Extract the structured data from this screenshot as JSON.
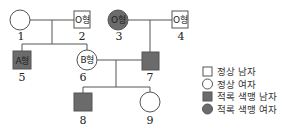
{
  "pedigree": {
    "individuals": [
      {
        "id": "1",
        "sex": "female",
        "status": "normal",
        "blood_type": ""
      },
      {
        "id": "2",
        "sex": "male",
        "status": "normal",
        "blood_type": "O형"
      },
      {
        "id": "3",
        "sex": "female",
        "status": "affected",
        "blood_type": "O형"
      },
      {
        "id": "4",
        "sex": "male",
        "status": "normal",
        "blood_type": "O형"
      },
      {
        "id": "5",
        "sex": "male",
        "status": "affected",
        "blood_type": "A형"
      },
      {
        "id": "6",
        "sex": "female",
        "status": "normal",
        "blood_type": "B형"
      },
      {
        "id": "7",
        "sex": "male",
        "status": "affected",
        "blood_type": ""
      },
      {
        "id": "8",
        "sex": "male",
        "status": "affected",
        "blood_type": ""
      },
      {
        "id": "9",
        "sex": "female",
        "status": "normal",
        "blood_type": ""
      }
    ],
    "matings": [
      {
        "partners": [
          "1",
          "2"
        ],
        "children": [
          "5",
          "6"
        ]
      },
      {
        "partners": [
          "3",
          "4"
        ],
        "children": [
          "7"
        ]
      },
      {
        "partners": [
          "6",
          "7"
        ],
        "children": [
          "8",
          "9"
        ]
      }
    ]
  },
  "legend": {
    "items": [
      {
        "symbol": "square-outline",
        "label": "정상 남자"
      },
      {
        "symbol": "circle-outline",
        "label": "정상 여자"
      },
      {
        "symbol": "square-filled",
        "label": "적록 색맹 남자"
      },
      {
        "symbol": "circle-filled",
        "label": "적록 색맹 여자"
      }
    ]
  },
  "colors": {
    "affected_fill": "#6b6b6b",
    "line": "#555555"
  }
}
